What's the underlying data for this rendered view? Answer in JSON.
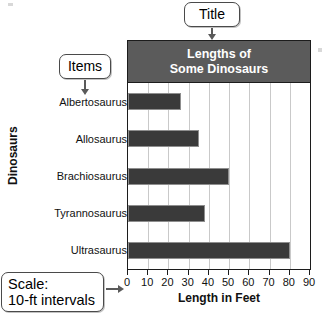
{
  "chart_data": {
    "type": "bar",
    "orientation": "horizontal",
    "title": "Lengths of Some Dinosaurs",
    "title_line1": "Lengths of",
    "title_line2": "Some Dinosaurs",
    "xlabel": "Length in Feet",
    "ylabel": "Dinosaurs",
    "xlim": [
      0,
      90
    ],
    "xticks": [
      "0",
      "10",
      "20",
      "30",
      "40",
      "50",
      "60",
      "70",
      "80",
      "90"
    ],
    "tick_interval": 10,
    "grid": true,
    "legend": "none",
    "bar_color": "#3a3a3a",
    "categories": [
      "Albertosaurus",
      "Allosaurus",
      "Brachiosaurus",
      "Tyrannosaurus",
      "Ultrasaurus"
    ],
    "values": [
      26,
      35,
      50,
      38,
      80
    ]
  },
  "callouts": {
    "title": {
      "label": "Title"
    },
    "items": {
      "label": "Items"
    },
    "scale": {
      "line1": "Scale:",
      "line2": "10-ft intervals"
    }
  },
  "colors": {
    "title_bar": "#5b5b5b",
    "bar": "#3a3a3a",
    "grid": "#c9c9c9",
    "frame": "#1c1c1c",
    "callout_border": "#4a4a4a"
  }
}
